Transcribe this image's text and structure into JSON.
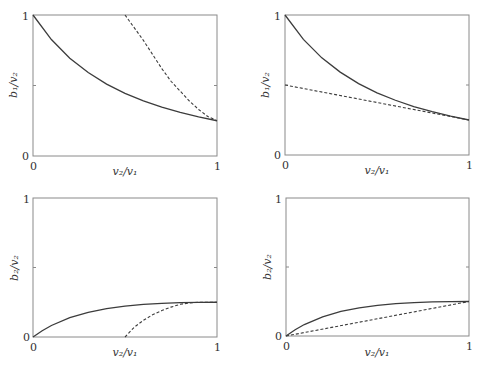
{
  "chart_data": [
    {
      "type": "line",
      "panel": "top-left",
      "xlabel": "v2/v1",
      "ylabel": "b1/v2",
      "xlabel_display": "v₂/v₁",
      "ylabel_display": "b₁/v₂",
      "xlim": [
        0,
        1
      ],
      "ylim": [
        0,
        1
      ],
      "xticks": [
        "0",
        "1"
      ],
      "yticks": [
        "0",
        "1"
      ],
      "grid": false,
      "series": [
        {
          "name": "solid",
          "style": "solid",
          "x": [
            0,
            0.1,
            0.2,
            0.3,
            0.4,
            0.5,
            0.6,
            0.7,
            0.8,
            0.9,
            1.0
          ],
          "y": [
            1.0,
            0.826,
            0.694,
            0.592,
            0.51,
            0.444,
            0.391,
            0.346,
            0.309,
            0.277,
            0.25
          ]
        },
        {
          "name": "dashed",
          "style": "dashed",
          "x": [
            0.5,
            0.55,
            0.6,
            0.65,
            0.7,
            0.75,
            0.8,
            0.85,
            0.9,
            0.95,
            1.0
          ],
          "y": [
            1.0,
            0.91,
            0.82,
            0.72,
            0.62,
            0.53,
            0.46,
            0.39,
            0.33,
            0.28,
            0.25
          ]
        }
      ]
    },
    {
      "type": "line",
      "panel": "top-right",
      "xlabel": "v2/v1",
      "ylabel": "b1/v2",
      "xlabel_display": "v₂/v₁",
      "ylabel_display": "b₁/v₂",
      "xlim": [
        0,
        1
      ],
      "ylim": [
        0,
        1
      ],
      "xticks": [
        "0",
        "1"
      ],
      "yticks": [
        "0",
        "1"
      ],
      "grid": false,
      "series": [
        {
          "name": "solid",
          "style": "solid",
          "x": [
            0,
            0.1,
            0.2,
            0.3,
            0.4,
            0.5,
            0.6,
            0.7,
            0.8,
            0.9,
            1.0
          ],
          "y": [
            1.0,
            0.826,
            0.694,
            0.592,
            0.51,
            0.444,
            0.391,
            0.346,
            0.309,
            0.277,
            0.25
          ]
        },
        {
          "name": "dashed",
          "style": "dashed",
          "x": [
            0,
            1.0
          ],
          "y": [
            0.5,
            0.25
          ]
        }
      ]
    },
    {
      "type": "line",
      "panel": "bottom-left",
      "xlabel": "v2/v1",
      "ylabel": "b2/v2",
      "xlabel_display": "v₂/v₁",
      "ylabel_display": "b₂/v₂",
      "xlim": [
        0,
        1
      ],
      "ylim": [
        0,
        1
      ],
      "xticks": [
        "0",
        "1"
      ],
      "yticks": [
        "0",
        "1"
      ],
      "grid": false,
      "series": [
        {
          "name": "solid",
          "style": "solid",
          "x": [
            0,
            0.05,
            0.1,
            0.2,
            0.3,
            0.4,
            0.5,
            0.6,
            0.7,
            0.8,
            0.9,
            1.0
          ],
          "y": [
            0,
            0.045,
            0.083,
            0.139,
            0.178,
            0.204,
            0.222,
            0.234,
            0.242,
            0.247,
            0.249,
            0.25
          ]
        },
        {
          "name": "dashed",
          "style": "dashed",
          "x": [
            0.5,
            0.55,
            0.6,
            0.65,
            0.7,
            0.75,
            0.8,
            0.85,
            0.9,
            1.0
          ],
          "y": [
            0,
            0.07,
            0.12,
            0.16,
            0.19,
            0.215,
            0.235,
            0.245,
            0.25,
            0.25
          ]
        }
      ]
    },
    {
      "type": "line",
      "panel": "bottom-right",
      "xlabel": "v2/v1",
      "ylabel": "b2/v2",
      "xlabel_display": "v₂/v₁",
      "ylabel_display": "b₂/v₂",
      "xlim": [
        0,
        1
      ],
      "ylim": [
        0,
        1
      ],
      "xticks": [
        "0",
        "1"
      ],
      "yticks": [
        "0",
        "1"
      ],
      "grid": false,
      "series": [
        {
          "name": "solid",
          "style": "solid",
          "x": [
            0,
            0.05,
            0.1,
            0.2,
            0.3,
            0.4,
            0.5,
            0.6,
            0.7,
            0.8,
            0.9,
            1.0
          ],
          "y": [
            0,
            0.045,
            0.083,
            0.139,
            0.178,
            0.204,
            0.222,
            0.234,
            0.242,
            0.247,
            0.249,
            0.25
          ]
        },
        {
          "name": "dashed",
          "style": "dashed",
          "x": [
            0,
            1.0
          ],
          "y": [
            0,
            0.25
          ]
        }
      ]
    }
  ],
  "panels": [
    {
      "x_tick_0": "0",
      "x_tick_1": "1",
      "y_tick_0": "0",
      "y_tick_1": "1",
      "xlabel": "v₂/v₁",
      "ylabel": "b₁/v₂"
    },
    {
      "x_tick_0": "0",
      "x_tick_1": "1",
      "y_tick_0": "0",
      "y_tick_1": "1",
      "xlabel": "v₂/v₁",
      "ylabel": "b₁/v₂"
    },
    {
      "x_tick_0": "0",
      "x_tick_1": "1",
      "y_tick_0": "0",
      "y_tick_1": "1",
      "xlabel": "v₂/v₁",
      "ylabel": "b₂/v₂"
    },
    {
      "x_tick_0": "0",
      "x_tick_1": "1",
      "y_tick_0": "0",
      "y_tick_1": "1",
      "xlabel": "v₂/v₁",
      "ylabel": "b₂/v₂"
    }
  ]
}
